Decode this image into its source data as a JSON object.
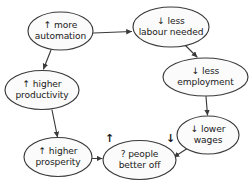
{
  "diagram": {
    "type": "causal-loop",
    "background_color": "#ffffff",
    "stroke_color": "#3a3a3a",
    "node_fill_color": "#fbfbfb",
    "text_color": "#1a1a1a",
    "nodes": [
      {
        "id": "more-automation",
        "arrow": "↑",
        "line1": "↑ more",
        "line2": "automation",
        "cx": 60.5,
        "cy": 31,
        "rx": 32.5,
        "ry": 19
      },
      {
        "id": "less-labour-needed",
        "arrow": "↓",
        "line1": "↓ less",
        "line2": "labour needed",
        "cx": 171,
        "cy": 27,
        "rx": 38,
        "ry": 20
      },
      {
        "id": "less-employment",
        "arrow": "↓",
        "line1": "↓ less",
        "line2": "employment",
        "cx": 205.5,
        "cy": 77,
        "rx": 42.5,
        "ry": 19
      },
      {
        "id": "lower-wages",
        "arrow": "↓",
        "line1": "↓ lower",
        "line2": "wages",
        "cx": 208,
        "cy": 135,
        "rx": 31,
        "ry": 19
      },
      {
        "id": "people-better-off",
        "arrow": "?",
        "line1": "? people",
        "line2": "better off",
        "cx": 139.5,
        "cy": 160,
        "rx": 36.5,
        "ry": 19.5
      },
      {
        "id": "higher-prosperity",
        "arrow": "↑",
        "line1": "↑ higher",
        "line2": "prosperity",
        "cx": 58,
        "cy": 157,
        "rx": 34,
        "ry": 19.5
      },
      {
        "id": "higher-productivity",
        "arrow": "↑",
        "line1": "↑ higher",
        "line2": "productivity",
        "cx": 42,
        "cy": 90,
        "rx": 37,
        "ry": 19.5
      }
    ],
    "edges": [
      {
        "id": "automation-to-labour",
        "from": "more-automation",
        "to": "less-labour-needed",
        "path": "M 93.5 33 L 131.5 31.5"
      },
      {
        "id": "automation-to-productivity",
        "from": "more-automation",
        "to": "higher-productivity",
        "path": "M 51 50 L 43.5 69"
      },
      {
        "id": "labour-to-employment",
        "from": "less-labour-needed",
        "to": "less-employment",
        "path": "M 186 46 L 197 57"
      },
      {
        "id": "employment-to-wages",
        "from": "less-employment",
        "to": "lower-wages",
        "path": "M 206 96.5 L 207.5 115"
      },
      {
        "id": "wages-to-better-off",
        "from": "lower-wages",
        "to": "people-better-off",
        "path": "M 188 148 L 174 157"
      },
      {
        "id": "prosperity-to-better-off",
        "from": "higher-prosperity",
        "to": "people-better-off",
        "path": "M 92.5 158.5 L 102 158.5"
      },
      {
        "id": "productivity-to-prosperity",
        "from": "higher-productivity",
        "to": "higher-prosperity",
        "path": "M 52 110 L 57.5 137"
      }
    ],
    "standalone_markers": [
      {
        "id": "up-marker-left-of-better-off",
        "glyph": "↑",
        "x": 105,
        "y": 133
      },
      {
        "id": "down-marker-right-of-better-off",
        "glyph": "↓",
        "x": 166,
        "y": 133
      }
    ]
  }
}
